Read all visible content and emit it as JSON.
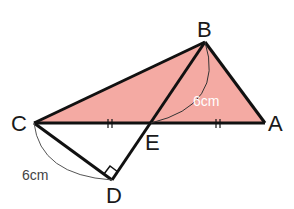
{
  "diagram": {
    "points": {
      "A": "A",
      "B": "B",
      "C": "C",
      "D": "D",
      "E": "E"
    },
    "lengths": {
      "BE": "6cm",
      "CD": "6cm"
    },
    "fill_color": "#f2a8a0",
    "line_color": "#111111"
  }
}
